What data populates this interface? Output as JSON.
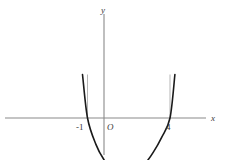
{
  "figure": {
    "type": "cartesian-graph",
    "background_color": "#ffffff",
    "curve_color": "#1a1a1a",
    "axis_color": "#8a8a8a",
    "dropline_color": "#b5b5b5",
    "text_color": "#3a3a3a"
  },
  "axes": {
    "x_label": "x",
    "y_label": "y",
    "origin_label": "O"
  },
  "ticks": {
    "x": [
      {
        "label": "-1",
        "value": -1
      },
      {
        "label": "4",
        "value": 4
      }
    ]
  },
  "chart_data": {
    "type": "line",
    "title": "",
    "xlabel": "x",
    "ylabel": "y",
    "grid": false,
    "legend": null,
    "xlim": [
      -1.6,
      5.4
    ],
    "ylim": [
      -3.2,
      7.0
    ],
    "annotations": [
      {
        "text": "-1",
        "x": -1,
        "y": 0,
        "role": "x-intercept-tick"
      },
      {
        "text": "4",
        "x": 4,
        "y": 0,
        "role": "x-intercept-tick"
      },
      {
        "text": "O",
        "x": 0,
        "y": 0,
        "role": "origin"
      }
    ],
    "series": [
      {
        "name": "parabola",
        "equation": "y = (x + 1)(x - 4)",
        "roots": [
          -1,
          4
        ],
        "vertex": [
          1.5,
          -6.25
        ],
        "x": [
          -1.3,
          -1.0,
          -0.5,
          0.0,
          0.5,
          1.0,
          1.5,
          2.0,
          2.5,
          3.0,
          3.5,
          4.0,
          4.3
        ],
        "values": [
          5.0,
          0.0,
          -3.0,
          -4.8,
          -5.8,
          -6.2,
          -6.25,
          -6.0,
          -5.2,
          -3.9,
          -2.2,
          0.0,
          5.0
        ]
      }
    ],
    "droplines": [
      {
        "x": -1,
        "from_y": 0,
        "to_y": 5.0
      },
      {
        "x": 4,
        "from_y": 0,
        "to_y": 5.0
      }
    ]
  }
}
